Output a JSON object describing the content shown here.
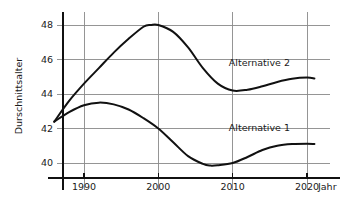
{
  "chart_data": {
    "type": "line",
    "title": "",
    "subtitle": "",
    "xlabel": "Jahr",
    "ylabel": "Durschnittsalter",
    "grid": true,
    "legend_position": "inline-right",
    "xlim": [
      1986,
      2022
    ],
    "ylim": [
      39.0,
      48.6
    ],
    "x_ticks": [
      1990,
      2000,
      2010,
      2020
    ],
    "x_tick_labels": [
      "1990",
      "2000",
      "2010",
      "2020"
    ],
    "y_ticks": [
      40,
      42,
      44,
      46,
      48
    ],
    "y_tick_labels": [
      "40",
      "42",
      "44",
      "46",
      "48"
    ],
    "series": [
      {
        "name": "Alternative 2",
        "label": "Alternative 2",
        "color": "#111111",
        "x": [
          1986,
          1988,
          1990,
          1992,
          1994,
          1996,
          1998,
          1999,
          2000,
          2002,
          2004,
          2006,
          2008,
          2010,
          2012,
          2014,
          2016,
          2018,
          2020,
          2021
        ],
        "values": [
          42.4,
          43.6,
          44.6,
          45.5,
          46.4,
          47.2,
          47.9,
          48.0,
          48.0,
          47.6,
          46.7,
          45.5,
          44.6,
          44.2,
          44.25,
          44.45,
          44.7,
          44.88,
          44.95,
          44.9
        ]
      },
      {
        "name": "Alternative 1",
        "label": "Alternative 1",
        "color": "#111111",
        "x": [
          1986,
          1988,
          1990,
          1992,
          1994,
          1996,
          1998,
          2000,
          2002,
          2004,
          2006,
          2007,
          2008,
          2010,
          2012,
          2014,
          2016,
          2018,
          2020,
          2021
        ],
        "values": [
          42.4,
          42.95,
          43.35,
          43.5,
          43.4,
          43.1,
          42.6,
          42.0,
          41.2,
          40.4,
          39.95,
          39.85,
          39.87,
          40.0,
          40.35,
          40.75,
          41.0,
          41.1,
          41.12,
          41.1
        ]
      }
    ],
    "annotations": [
      {
        "text": "Alternative 2",
        "x": 2013.6,
        "y": 45.8
      },
      {
        "text": "Alternative 1",
        "x": 2013.6,
        "y": 42.05
      }
    ]
  }
}
